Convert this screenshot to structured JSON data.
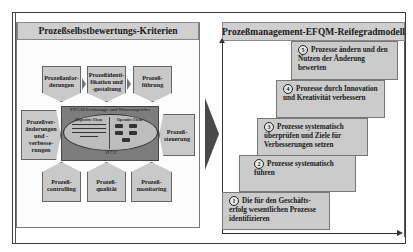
{
  "left_panel": {
    "title": "Prozeßselbstbewertungs-Kriterien",
    "criteria": [
      {
        "id": "anforderungen",
        "label": "Prozeßanfor-derungen"
      },
      {
        "id": "identifikation",
        "label": "Prozeßidenti-fikation und -gestaltung"
      },
      {
        "id": "fuehrung",
        "label": "Prozeß-führung"
      },
      {
        "id": "veraenderungen",
        "label": "Prozeßver-änderungen und -verbesse-rungen"
      },
      {
        "id": "steuerung",
        "label": "Prozeß-steuerung"
      },
      {
        "id": "controlling",
        "label": "Prozeß-controlling"
      },
      {
        "id": "qualitaet",
        "label": "Prozeß-qualität"
      },
      {
        "id": "monitoring",
        "label": "Prozeß-monitoring"
      }
    ],
    "core": {
      "title": "SYCAT-Erfahrungs- und Wissensspeicher",
      "left_section": "Dispositive Ebene",
      "right_section": "Operative Ebene",
      "bottom_label": "SYCAT"
    }
  },
  "right_panel": {
    "title": "Prozeßmanagement-EFQM-Reifegradmodell",
    "steps": [
      {
        "num": "5",
        "text": "Prozesse ändern und den Nutzen der Änderung bewerten"
      },
      {
        "num": "4",
        "text": "Prozesse durch Innovation und Kreativität verbessern"
      },
      {
        "num": "3",
        "text": "Prozesse systematisch überprüfen und Ziele für Verbesserungen setzen"
      },
      {
        "num": "2",
        "text": "Prozesse systematisch führen"
      },
      {
        "num": "1",
        "text": "Die für den Geschäfts-erfolg wesentlichen Prozesse identifizieren"
      }
    ]
  },
  "colors": {
    "box_fill": "#c9c9c9",
    "core_fill": "#7d7d7d",
    "arrow": "#4a4a4a",
    "border": "#3a3a3a"
  }
}
